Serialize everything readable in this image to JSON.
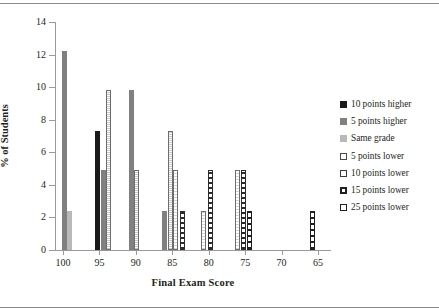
{
  "chart_data": {
    "type": "bar",
    "title": "",
    "xlabel": "Final Exam Score",
    "ylabel": "% of Students",
    "categories": [
      "100",
      "95",
      "90",
      "85",
      "80",
      "75",
      "70",
      "65"
    ],
    "xlim_reversed": true,
    "ylim": [
      0,
      14
    ],
    "ytick_values": [
      "0",
      "2",
      "4",
      "6",
      "8",
      "10",
      "12",
      "14"
    ],
    "grid": false,
    "legend_position": "right",
    "series": [
      {
        "name": "10 points higher",
        "swatch": "sw-black",
        "style": "s-black",
        "values": [
          0,
          7.3,
          0,
          0,
          0,
          0,
          0,
          0
        ]
      },
      {
        "name": "5 points higher",
        "swatch": "sw-dgray",
        "style": "s-dgray",
        "values": [
          12.2,
          4.9,
          9.8,
          2.4,
          0,
          0,
          0,
          0
        ]
      },
      {
        "name": "Same grade",
        "swatch": "sw-lgray",
        "style": "s-lgray",
        "values": [
          2.4,
          0,
          0,
          0,
          0,
          0,
          0,
          0
        ]
      },
      {
        "name": "5 points lower",
        "swatch": "sw-dot",
        "style": "s-dot",
        "values": [
          0,
          9.8,
          4.9,
          7.3,
          0,
          0,
          0,
          0
        ]
      },
      {
        "name": "10 points lower",
        "swatch": "sw-chk",
        "style": "s-chk",
        "values": [
          0,
          0,
          0,
          4.9,
          2.4,
          4.9,
          0,
          0
        ]
      },
      {
        "name": "15 points lower",
        "swatch": "sw-lad",
        "style": "s-lad",
        "values": [
          0,
          0,
          0,
          2.4,
          4.9,
          4.9,
          0,
          0
        ]
      },
      {
        "name": "25 points lower",
        "swatch": "sw-sq",
        "style": "s-sq",
        "values": [
          0,
          0,
          0,
          0,
          0,
          2.4,
          0,
          2.4
        ]
      }
    ],
    "bars": [
      {
        "series": "5 points higher",
        "style": "s-dgray",
        "category": "100",
        "value": 12.2,
        "x": 6.5
      },
      {
        "series": "Same grade",
        "style": "s-lgray",
        "category": "100",
        "value": 2.4,
        "x": 12.0
      },
      {
        "series": "10 points higher",
        "style": "s-black",
        "category": "95",
        "value": 7.3,
        "x": 40.0
      },
      {
        "series": "5 points higher",
        "style": "s-dgray",
        "category": "95",
        "value": 4.9,
        "x": 45.5
      },
      {
        "series": "5 points lower",
        "style": "s-dot",
        "category": "95",
        "value": 9.8,
        "x": 51.0
      },
      {
        "series": "5 points higher",
        "style": "s-dgray",
        "category": "90",
        "value": 9.8,
        "x": 73.5
      },
      {
        "series": "5 points lower",
        "style": "s-dot",
        "category": "90",
        "value": 4.9,
        "x": 79.0
      },
      {
        "series": "5 points higher",
        "style": "s-dgray",
        "category": "85",
        "value": 2.4,
        "x": 107.0
      },
      {
        "series": "5 points lower",
        "style": "s-dot",
        "category": "85",
        "value": 7.3,
        "x": 112.5
      },
      {
        "series": "10 points lower",
        "style": "s-chk",
        "category": "85",
        "value": 4.9,
        "x": 118.0
      },
      {
        "series": "15 points lower",
        "style": "s-lad",
        "category": "85",
        "value": 2.4,
        "x": 124.5
      },
      {
        "series": "10 points lower",
        "style": "s-chk",
        "category": "80",
        "value": 2.4,
        "x": 146.0
      },
      {
        "series": "15 points lower",
        "style": "s-lad",
        "category": "80",
        "value": 4.9,
        "x": 152.5
      },
      {
        "series": "10 points lower",
        "style": "s-chk",
        "category": "75",
        "value": 4.9,
        "x": 180.0
      },
      {
        "series": "15 points lower",
        "style": "s-lad",
        "category": "75",
        "value": 4.9,
        "x": 186.0
      },
      {
        "series": "25 points lower",
        "style": "s-sq",
        "category": "75",
        "value": 2.4,
        "x": 192.0
      },
      {
        "series": "25 points lower",
        "style": "s-sq",
        "category": "65",
        "value": 2.4,
        "x": 254.5
      }
    ]
  }
}
